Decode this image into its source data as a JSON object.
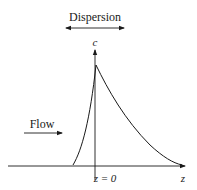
{
  "diagram": {
    "type": "concentration-profile",
    "labels": {
      "dispersion": "Dispersion",
      "concentration_axis": "c",
      "flow": "Flow",
      "origin": "z = 0",
      "position_axis": "z"
    },
    "colors": {
      "stroke": "#1a1a1a",
      "background": "#ffffff"
    },
    "curve": {
      "description": "Concentration pulse: steep rise left of z=0, sharp peak just right of z=0, exponential-like decay toward +z",
      "peak_relative": "just right of z=0"
    }
  }
}
